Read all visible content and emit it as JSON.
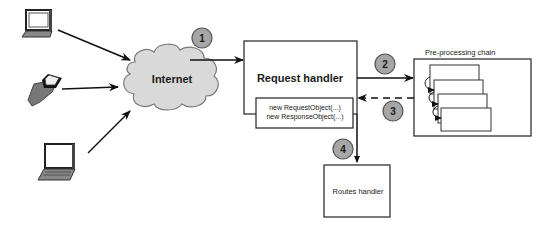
{
  "diagram": {
    "clients": [
      {
        "name": "desktop-computer"
      },
      {
        "name": "handheld-device"
      },
      {
        "name": "laptop"
      }
    ],
    "internet": {
      "label": "Internet"
    },
    "request_handler": {
      "label": "Request handler",
      "inner_lines": [
        "new RequestObject(...)",
        "new ResponseObject(...)"
      ]
    },
    "preprocessing": {
      "label": "Pre-processing chain",
      "stages": 4
    },
    "routes_handler": {
      "label": "Routes handler"
    },
    "steps": [
      {
        "number": "1"
      },
      {
        "number": "2"
      },
      {
        "number": "3"
      },
      {
        "number": "4"
      }
    ],
    "colors": {
      "stroke": "#222222",
      "badge_fill": "#a6a6a6",
      "cloud_fill": "#d9d9d9"
    }
  }
}
